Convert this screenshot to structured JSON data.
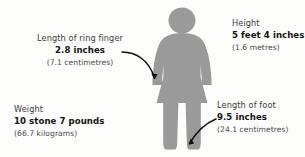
{
  "diagram": {
    "figure": {
      "name": "female-silhouette",
      "color": "#9a9a9a"
    },
    "background_color": "#fdfdfc",
    "annotations": [
      {
        "id": "ring-finger",
        "label": "Length of ring finger",
        "value": "2.8 inches",
        "metric": "(7.1 centimetres)",
        "points_to": "hand"
      },
      {
        "id": "height",
        "label": "Height",
        "value": "5 feet 4 inches",
        "metric": "(1.6 metres)",
        "points_to": "whole-body"
      },
      {
        "id": "weight",
        "label": "Weight",
        "value": "10 stone 7 pounds",
        "metric": "(66.7 kilograms)",
        "points_to": "whole-body"
      },
      {
        "id": "foot",
        "label": "Length of foot",
        "value": "9.5 inches",
        "metric": "(24.1 centimetres)",
        "points_to": "foot"
      }
    ],
    "arrows": [
      {
        "id": "arrow-to-hand",
        "from": "ring-finger-annotation",
        "to": "left-hand"
      },
      {
        "id": "arrow-to-foot",
        "from": "foot-annotation",
        "to": "right-foot"
      }
    ]
  }
}
